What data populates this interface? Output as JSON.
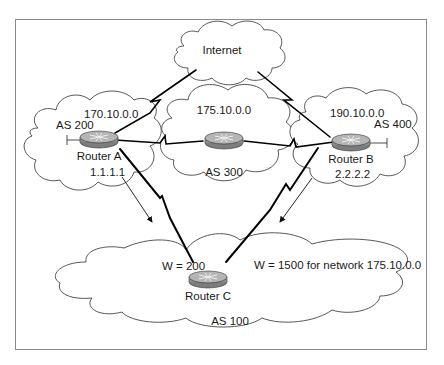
{
  "diagram": {
    "type": "network-topology",
    "clouds": [
      {
        "id": "internet",
        "label": "Internet"
      },
      {
        "id": "as200",
        "label": "AS 200",
        "network": "170.10.0.0"
      },
      {
        "id": "as300",
        "label": "AS 300",
        "network": "175.10.0.0"
      },
      {
        "id": "as400",
        "label": "AS 400",
        "network": "190.10.0.0"
      },
      {
        "id": "as100",
        "label": "AS 100"
      }
    ],
    "routers": [
      {
        "id": "router-a",
        "label": "Router A",
        "address": "1.1.1.1"
      },
      {
        "id": "router-as300",
        "label": ""
      },
      {
        "id": "router-b",
        "label": "Router B",
        "address": "2.2.2.2"
      },
      {
        "id": "router-c",
        "label": "Router C"
      }
    ],
    "annotations": {
      "weight_a": "W = 200",
      "weight_b": "W = 1500 for network 175.10.0.0"
    },
    "links": [
      {
        "from": "router-a",
        "to": "internet",
        "style": "serial"
      },
      {
        "from": "router-b",
        "to": "internet",
        "style": "serial"
      },
      {
        "from": "router-a",
        "to": "router-as300",
        "style": "serial"
      },
      {
        "from": "router-as300",
        "to": "router-b",
        "style": "serial"
      },
      {
        "from": "router-a",
        "to": "router-c",
        "style": "serial"
      },
      {
        "from": "router-b",
        "to": "router-c",
        "style": "serial"
      }
    ],
    "colors": {
      "frame": "#8a8a8a",
      "cloud_stroke": "#444444",
      "router_body": "#9a9a9a",
      "router_top": "#b8b8b8",
      "link": "#000000"
    }
  }
}
